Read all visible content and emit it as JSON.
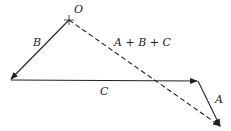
{
  "diagram": {
    "type": "vector-addition",
    "labels": {
      "origin": "O",
      "b": "B",
      "c": "C",
      "a": "A",
      "sum": "A + B + C"
    },
    "points": {
      "O": [
        69,
        20
      ],
      "P1": [
        10,
        80
      ],
      "P2": [
        198,
        81
      ],
      "P3": [
        221,
        127
      ]
    },
    "colors": {
      "line": "#222222",
      "background": "#ffffff"
    }
  }
}
